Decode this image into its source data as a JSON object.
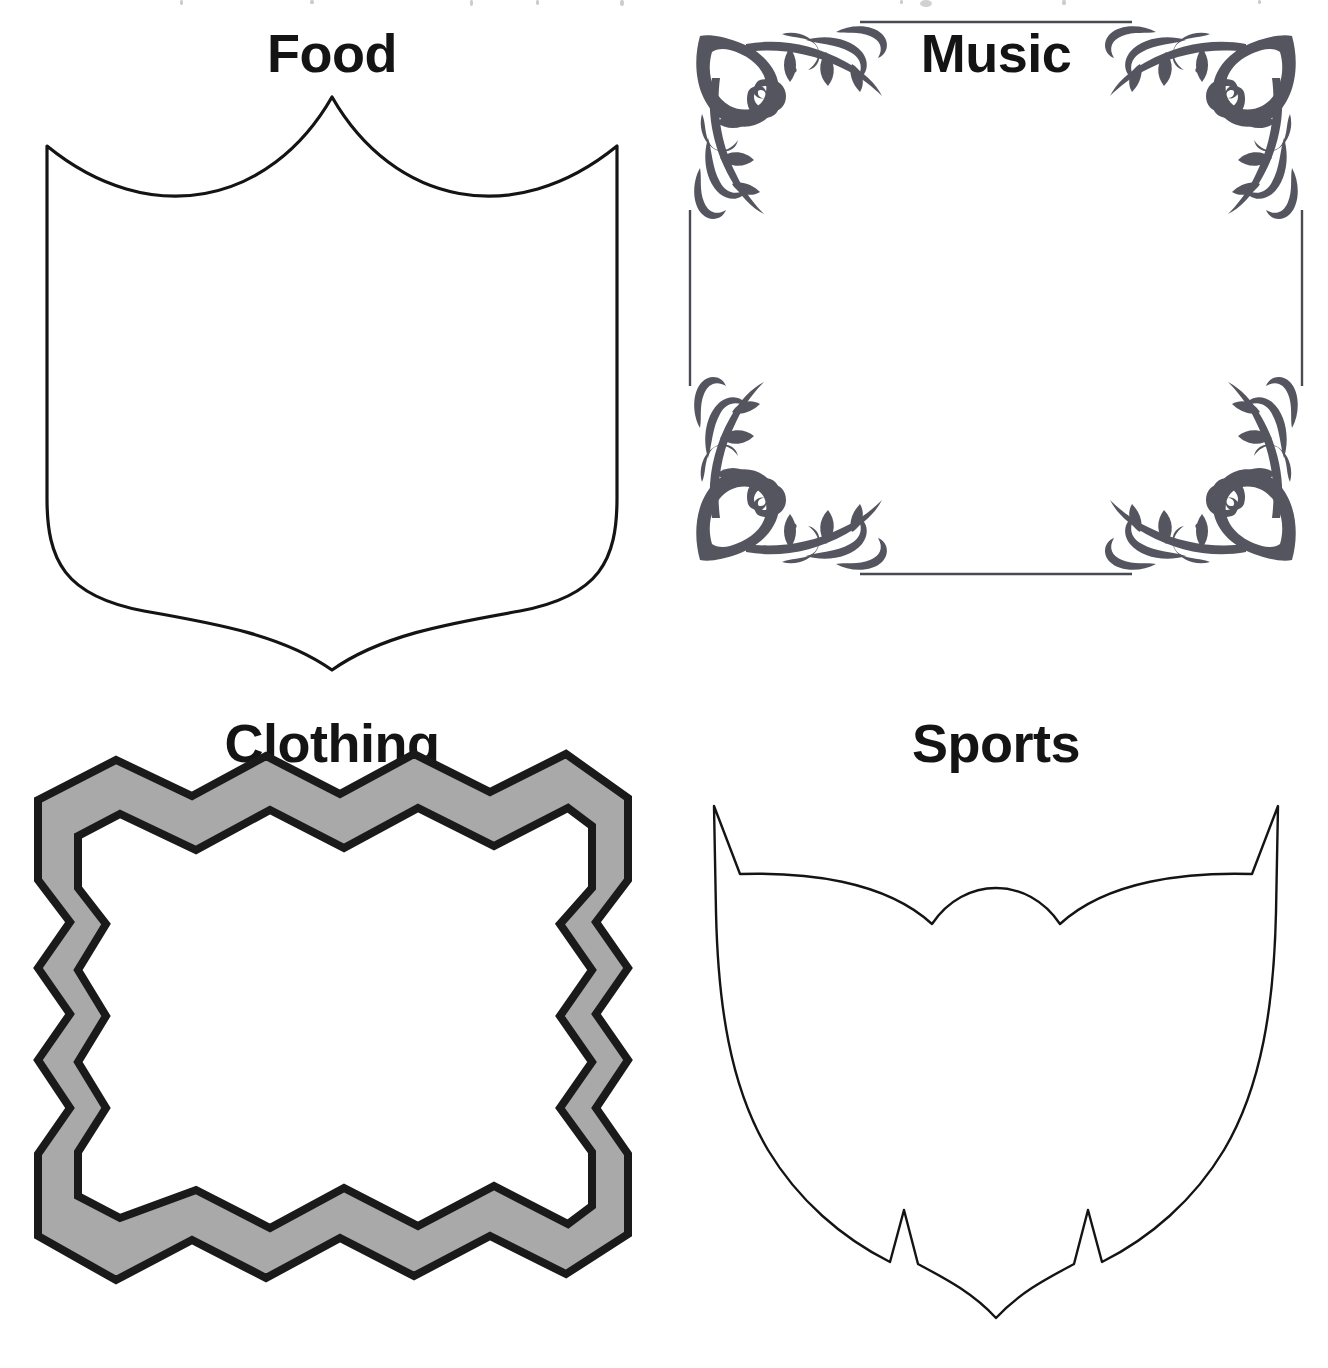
{
  "page": {
    "background_color": "#ffffff",
    "ink_color": "#141414",
    "gray_fill_color": "#a9a9a9",
    "ornament_color": "#555560",
    "layout": "2x2 grid of decorative label frames",
    "top_edge_artifact": "faint cropped text remnants along the very top edge"
  },
  "cells": [
    {
      "id": "food",
      "title": "Food",
      "shape_name": "pointed-crest-shield",
      "shape_description": "Shield with concave curved top rising to a central point, straight sides, rounded bottom corners curving to a central downward point",
      "fill": "#ffffff",
      "stroke": "#141414",
      "stroke_width": 3,
      "has_gray_band": false
    },
    {
      "id": "music",
      "title": "Music",
      "shape_name": "ornate-corner-frame",
      "shape_description": "Square frame made of four mirrored Victorian filigree corner ornaments joined by thin hairlines",
      "fill": "#ffffff",
      "stroke": "#555560",
      "stroke_width": 2,
      "has_gray_band": false
    },
    {
      "id": "clothing",
      "title": "Clothing",
      "shape_name": "zigzag-band-frame",
      "shape_description": "Rectangular frame with chevron / zigzag edges, gray band between inner and outer black outlines",
      "fill": "#ffffff",
      "band_fill": "#a9a9a9",
      "stroke": "#1a1a1a",
      "stroke_width": 7,
      "has_gray_band": true,
      "zigzag_peaks_top": 4,
      "zigzag_peaks_bottom": 4,
      "zigzag_peaks_side": 3
    },
    {
      "id": "sports",
      "title": "Sports",
      "shape_name": "notched-spiked-shield",
      "shape_description": "Thin-outline shield with spiked upper corners, shallow dipped top centre, bowed sides and two inward notches flanking a central bottom point",
      "fill": "#ffffff",
      "stroke": "#141414",
      "stroke_width": 2,
      "has_gray_band": false
    }
  ]
}
